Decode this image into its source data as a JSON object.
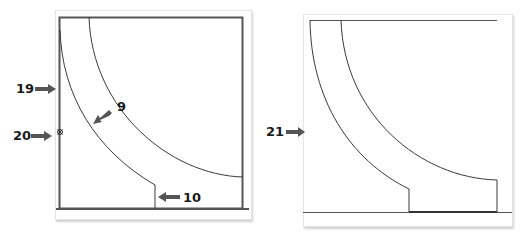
{
  "figure": {
    "left_panel": {
      "callouts": [
        {
          "id": "19",
          "label": "19",
          "target": "vessel wall"
        },
        {
          "id": "20",
          "label": "20",
          "target": "marker on wall"
        },
        {
          "id": "9",
          "label": "9",
          "target": "curved channel"
        },
        {
          "id": "10",
          "label": "10",
          "target": "channel exit step"
        }
      ]
    },
    "right_panel": {
      "callouts": [
        {
          "id": "21",
          "label": "21",
          "target": "open side (no wall)"
        }
      ]
    },
    "colors": {
      "line": "#3a3a3a",
      "wall": "#555555",
      "arrow": "#555555",
      "text": "#1a1a1a"
    }
  }
}
